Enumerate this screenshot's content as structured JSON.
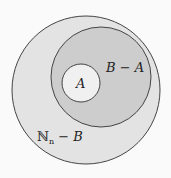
{
  "diagram": {
    "type": "venn-nested-sets",
    "colors": {
      "background": "#fafafa",
      "outer_fill": "#e3e3e3",
      "middle_fill": "#cdcdcd",
      "inner_fill": "#f0f0f0",
      "stroke": "#444444"
    },
    "sets": [
      {
        "id": "Nn",
        "label": "ℕₙ − B",
        "label_main": "ℕ",
        "label_sub": "n",
        "label_rest": " − B"
      },
      {
        "id": "B",
        "label": "B − A"
      },
      {
        "id": "A",
        "label": "A"
      }
    ]
  }
}
